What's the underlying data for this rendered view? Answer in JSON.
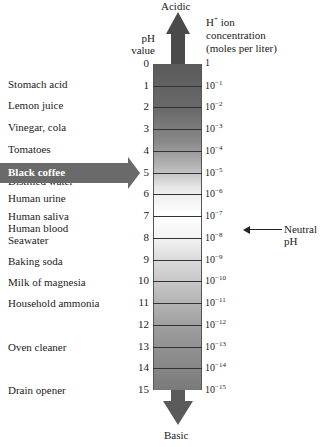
{
  "title_top": "Acidic",
  "title_bottom": "Basic",
  "ph_header": [
    "pH",
    "value"
  ],
  "h_header": {
    "prefix": "H",
    "sup": "+",
    "rest": " ion",
    "line2": "concentration",
    "line3": "(moles per liter)"
  },
  "neutral_label": "Neutral pH",
  "highlight": {
    "label": "Black coffee",
    "ph": 5
  },
  "colors": {
    "column_dark": "#5a5a5a",
    "column_light": "#ffffff",
    "arrow": "#4a4a4a",
    "highlight": "#6a6a6a"
  },
  "scale": [
    {
      "ph": "0",
      "conc_base": "1",
      "conc_exp": ""
    },
    {
      "ph": "1",
      "conc_base": "10",
      "conc_exp": "−1"
    },
    {
      "ph": "2",
      "conc_base": "10",
      "conc_exp": "−2"
    },
    {
      "ph": "3",
      "conc_base": "10",
      "conc_exp": "−3"
    },
    {
      "ph": "4",
      "conc_base": "10",
      "conc_exp": "−4"
    },
    {
      "ph": "5",
      "conc_base": "10",
      "conc_exp": "−5"
    },
    {
      "ph": "6",
      "conc_base": "10",
      "conc_exp": "−6"
    },
    {
      "ph": "7",
      "conc_base": "10",
      "conc_exp": "−7"
    },
    {
      "ph": "8",
      "conc_base": "10",
      "conc_exp": "−8"
    },
    {
      "ph": "9",
      "conc_base": "10",
      "conc_exp": "−9"
    },
    {
      "ph": "10",
      "conc_base": "10",
      "conc_exp": "−10"
    },
    {
      "ph": "11",
      "conc_base": "10",
      "conc_exp": "−11"
    },
    {
      "ph": "12",
      "conc_base": "10",
      "conc_exp": "−12"
    },
    {
      "ph": "13",
      "conc_base": "10",
      "conc_exp": "−13"
    },
    {
      "ph": "14",
      "conc_base": "10",
      "conc_exp": "−14"
    },
    {
      "ph": "15",
      "conc_base": "10",
      "conc_exp": "−15"
    }
  ],
  "substances": [
    {
      "label": "Stomach acid",
      "top": 84
    },
    {
      "label": "Lemon juice",
      "top": 105
    },
    {
      "label": "Vinegar, cola",
      "top": 127
    },
    {
      "label": "Tomatoes",
      "top": 149
    },
    {
      "label": "Distilled water",
      "top": 181
    },
    {
      "label": "Human urine",
      "top": 198
    },
    {
      "label": "Human saliva",
      "top": 216
    },
    {
      "label": "Human blood",
      "top": 228
    },
    {
      "label": "Seawater",
      "top": 240
    },
    {
      "label": "Baking soda",
      "top": 261
    },
    {
      "label": "Milk of magnesia",
      "top": 282
    },
    {
      "label": "Household ammonia",
      "top": 303
    },
    {
      "label": "Oven cleaner",
      "top": 347
    },
    {
      "label": "Drain opener",
      "top": 390
    }
  ]
}
